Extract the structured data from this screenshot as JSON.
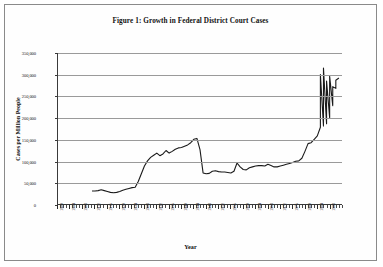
{
  "figure": {
    "title": "Figure 1: Growth in Federal District Court Cases",
    "xlabel": "Year",
    "ylabel": "Cases per Million People"
  },
  "chart_data": {
    "type": "line",
    "title": "Figure 1: Growth in Federal District Court Cases",
    "xlabel": "Year",
    "ylabel": "Cases per Million People",
    "xlim": [
      1900,
      1992
    ],
    "ylim": [
      0,
      350000
    ],
    "grid": true,
    "legend_position": "none",
    "line_color": "#1a1a1a",
    "ytick_labels": [
      "0",
      "50,000",
      "100,000",
      "150,000",
      "200,000",
      "250,000",
      "300,000",
      "350,000"
    ],
    "ytick_values": [
      0,
      50000,
      100000,
      150000,
      200000,
      250000,
      300000,
      350000
    ],
    "xtick_labels": [
      "1900",
      "1904",
      "1908",
      "1912",
      "1916",
      "1920",
      "1924",
      "1928",
      "1932",
      "1936",
      "1940",
      "1944",
      "1948",
      "1952",
      "1956",
      "1960",
      "1964",
      "1968",
      "1972",
      "1976",
      "1980",
      "1984",
      "1988"
    ],
    "xtick_values": [
      1900,
      1904,
      1908,
      1912,
      1916,
      1920,
      1924,
      1928,
      1932,
      1936,
      1940,
      1944,
      1948,
      1952,
      1956,
      1960,
      1964,
      1968,
      1972,
      1976,
      1980,
      1984,
      1988
    ],
    "xtick_minor_step": 1,
    "series": [
      {
        "name": "Cases per Million People",
        "x": [
          1911,
          1912,
          1913,
          1914,
          1915,
          1916,
          1917,
          1918,
          1919,
          1920,
          1921,
          1922,
          1923,
          1924,
          1925,
          1926,
          1927,
          1928,
          1929,
          1930,
          1931,
          1932,
          1933,
          1934,
          1935,
          1936,
          1937,
          1938,
          1939,
          1940,
          1941,
          1942,
          1943,
          1944,
          1945,
          1946,
          1947,
          1948,
          1949,
          1950,
          1951,
          1952,
          1953,
          1954,
          1955,
          1956,
          1957,
          1958,
          1959,
          1960,
          1961,
          1962,
          1963,
          1964,
          1965,
          1966,
          1967,
          1968,
          1969,
          1970,
          1971,
          1972,
          1973,
          1974,
          1975,
          1976,
          1977,
          1978,
          1979,
          1980,
          1981,
          1982,
          1983,
          1984,
          1985,
          1986,
          1987,
          1988,
          1989,
          1990,
          1991
        ],
        "values": [
          30000,
          30000,
          31000,
          33000,
          31000,
          29000,
          27000,
          26000,
          27000,
          29000,
          32000,
          34000,
          36000,
          38000,
          39000,
          52000,
          70000,
          88000,
          100000,
          108000,
          113000,
          118000,
          112000,
          116000,
          124000,
          118000,
          122000,
          127000,
          130000,
          131000,
          134000,
          137000,
          142000,
          150000,
          152000,
          126000,
          72000,
          70000,
          71000,
          76000,
          77000,
          75000,
          74000,
          74000,
          73000,
          72000,
          76000,
          95000,
          86000,
          80000,
          79000,
          84000,
          86000,
          88000,
          89000,
          89000,
          88000,
          92000,
          89000,
          86000,
          86000,
          88000,
          90000,
          92000,
          94000,
          96000,
          99000,
          100000,
          106000,
          122000,
          140000,
          142000,
          150000,
          158000,
          178000,
          181000,
          186000,
          200000,
          228000,
          268000,
          292000
        ],
        "style": "solid",
        "width": 1.1
      }
    ]
  },
  "peak_tail": {
    "x": [
      1985,
      1986,
      1987,
      1988,
      1989,
      1990
    ],
    "values": [
      300000,
      315000,
      285000,
      296000,
      272000,
      287000
    ]
  }
}
